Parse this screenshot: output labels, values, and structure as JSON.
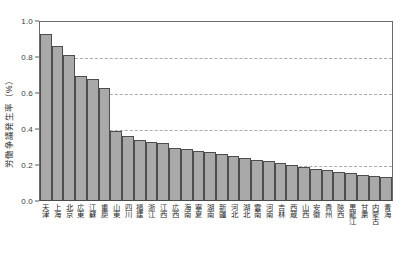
{
  "chart_data": {
    "type": "bar",
    "title": "",
    "xlabel": "",
    "ylabel": "労働争議発生率（%）",
    "ylim": [
      0.0,
      1.0
    ],
    "grid": "horizontal-dashed",
    "legend": "none",
    "ytick_labels": [
      "1.0",
      "0.8",
      "0.6",
      "0.4",
      "0.2",
      "0.0"
    ],
    "ytick_values": [
      1.0,
      0.8,
      0.6,
      0.4,
      0.2,
      0.0
    ],
    "gridline_values": [
      0.8,
      0.6,
      0.4,
      0.2
    ],
    "bar_color": "#a9a9a9",
    "bar_edge_color": "#4d4d4d",
    "categories": [
      "天津",
      "上海",
      "北京",
      "広東",
      "江蘇",
      "重慶",
      "山東",
      "四川",
      "福建",
      "浙江",
      "江西",
      "広西",
      "海南",
      "寧夏",
      "湖南",
      "新疆",
      "河北",
      "湖北",
      "雲南",
      "河南",
      "吉林",
      "西蔵",
      "山西",
      "安徽",
      "貴州",
      "陝西",
      "黒龍江",
      "甘粛",
      "内蒙古",
      "青海"
    ],
    "values": [
      0.92,
      0.855,
      0.805,
      0.69,
      0.675,
      0.62,
      0.385,
      0.355,
      0.335,
      0.325,
      0.315,
      0.29,
      0.285,
      0.275,
      0.265,
      0.255,
      0.245,
      0.235,
      0.225,
      0.215,
      0.205,
      0.195,
      0.185,
      0.175,
      0.165,
      0.155,
      0.15,
      0.14,
      0.135,
      0.13
    ]
  }
}
